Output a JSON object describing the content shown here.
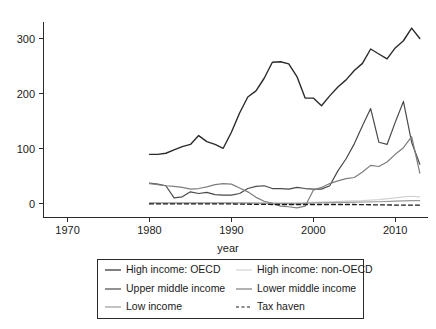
{
  "chart_data": {
    "type": "line",
    "title": "",
    "xlabel": "year",
    "ylabel": "",
    "xlim": [
      1967,
      2014
    ],
    "ylim": [
      -20,
      330
    ],
    "xticks": [
      1970,
      1980,
      1990,
      2000,
      2010
    ],
    "yticks": [
      0,
      100,
      200,
      300
    ],
    "grid": false,
    "legend_position": "bottom",
    "legend_columns": 2,
    "series": [
      {
        "name": "High income: OECD",
        "color": "#2b2b2b",
        "style": "solid",
        "width": 1.4,
        "x": [
          1980,
          1981,
          1982,
          1983,
          1984,
          1985,
          1986,
          1987,
          1988,
          1989,
          1990,
          1991,
          1992,
          1993,
          1994,
          1995,
          1996,
          1997,
          1998,
          1999,
          2000,
          2001,
          2002,
          2003,
          2004,
          2005,
          2006,
          2007,
          2008,
          2009,
          2010,
          2011,
          2012,
          2013
        ],
        "y": [
          90,
          90,
          92,
          98,
          104,
          108,
          124,
          113,
          108,
          101,
          130,
          165,
          194,
          205,
          228,
          257,
          258,
          254,
          231,
          192,
          192,
          178,
          196,
          212,
          225,
          242,
          255,
          281,
          272,
          263,
          283,
          296,
          319,
          300
        ]
      },
      {
        "name": "High income: non-OECD",
        "color": "#d2d2d2",
        "style": "solid",
        "width": 1.2,
        "x": [
          1980,
          1985,
          1990,
          1995,
          2000,
          2002,
          2004,
          2006,
          2008,
          2010,
          2011,
          2012,
          2013
        ],
        "y": [
          1,
          1,
          2,
          2,
          3,
          4,
          5,
          6,
          8,
          11,
          13,
          14,
          13
        ]
      },
      {
        "name": "Upper middle income",
        "color": "#4a4a4a",
        "style": "solid",
        "width": 1.2,
        "x": [
          1980,
          1981,
          1982,
          1983,
          1984,
          1985,
          1986,
          1987,
          1988,
          1989,
          1990,
          1991,
          1992,
          1993,
          1994,
          1995,
          1996,
          1997,
          1998,
          1999,
          2000,
          2001,
          2002,
          2003,
          2004,
          2005,
          2006,
          2007,
          2008,
          2009,
          2010,
          2011,
          2012,
          2013
        ],
        "y": [
          38,
          36,
          33,
          11,
          13,
          22,
          19,
          21,
          17,
          16,
          16,
          19,
          28,
          32,
          33,
          28,
          28,
          27,
          30,
          28,
          27,
          27,
          33,
          60,
          82,
          109,
          142,
          173,
          112,
          108,
          148,
          186,
          112,
          72
        ]
      },
      {
        "name": "Lower middle income",
        "color": "#7d7d7d",
        "style": "solid",
        "width": 1.2,
        "x": [
          1980,
          1981,
          1982,
          1983,
          1984,
          1985,
          1986,
          1987,
          1988,
          1989,
          1990,
          1991,
          1992,
          1993,
          1994,
          1995,
          1996,
          1997,
          1998,
          1999,
          2000,
          2001,
          2002,
          2003,
          2004,
          2005,
          2006,
          2007,
          2008,
          2009,
          2010,
          2011,
          2012,
          2013
        ],
        "y": [
          37,
          35,
          33,
          32,
          30,
          27,
          28,
          31,
          35,
          37,
          36,
          29,
          22,
          12,
          5,
          1,
          -4,
          -5,
          -7,
          -4,
          25,
          30,
          37,
          42,
          46,
          48,
          58,
          70,
          68,
          76,
          90,
          102,
          122,
          56
        ]
      },
      {
        "name": "Low income",
        "color": "#9a9a9a",
        "style": "solid",
        "width": 1.2,
        "x": [
          1980,
          1985,
          1990,
          1995,
          1998,
          2000,
          2004,
          2008,
          2010,
          2012,
          2013
        ],
        "y": [
          2,
          2,
          2,
          1,
          0,
          2,
          3,
          4,
          5,
          6,
          6
        ]
      },
      {
        "name": "Tax haven",
        "color": "#1a1a1a",
        "style": "dashed",
        "width": 1.3,
        "x": [
          1980,
          1985,
          1990,
          1995,
          2000,
          2005,
          2010,
          2013
        ],
        "y": [
          0,
          0,
          0,
          -1,
          -1,
          -1,
          -2,
          -2
        ]
      }
    ]
  },
  "legend": {
    "entries": [
      {
        "label": "High income: OECD",
        "column": 0,
        "row": 0
      },
      {
        "label": "High income: non-OECD",
        "column": 1,
        "row": 0
      },
      {
        "label": "Upper middle income",
        "column": 0,
        "row": 1
      },
      {
        "label": "Lower middle income",
        "column": 1,
        "row": 1
      },
      {
        "label": "Low income",
        "column": 0,
        "row": 2
      },
      {
        "label": "Tax haven",
        "column": 1,
        "row": 2
      }
    ]
  },
  "axis": {
    "x_title": "year",
    "x_tick_labels": [
      "1970",
      "1980",
      "1990",
      "2000",
      "2010"
    ],
    "y_tick_labels": [
      "0",
      "100",
      "200",
      "300"
    ]
  }
}
